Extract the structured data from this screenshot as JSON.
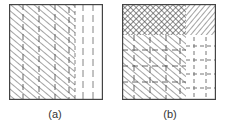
{
  "figure": {
    "panels": [
      {
        "id": "a",
        "label": "(a)",
        "regions": [
          {
            "name": "diagonal-hatch-with-dashed-verticals",
            "x_frac": [
              0,
              0.7
            ],
            "y_frac": [
              0,
              1
            ]
          },
          {
            "name": "dashed-vertical-lines",
            "x_frac": [
              0.7,
              1
            ],
            "y_frac": [
              0,
              1
            ]
          }
        ]
      },
      {
        "id": "b",
        "label": "(b)",
        "regions": [
          {
            "name": "cross-hatch",
            "x_frac": [
              0,
              0.68
            ],
            "y_frac": [
              0,
              0.33
            ]
          },
          {
            "name": "diagonal-hatch",
            "x_frac": [
              0.68,
              1
            ],
            "y_frac": [
              0,
              0.33
            ]
          },
          {
            "name": "diagonal-hatch-with-dashed-grid",
            "x_frac": [
              0,
              0.68
            ],
            "y_frac": [
              0.33,
              1
            ]
          },
          {
            "name": "dashed-crosses",
            "x_frac": [
              0.68,
              1
            ],
            "y_frac": [
              0.33,
              1
            ]
          }
        ]
      }
    ],
    "colors": {
      "line": "#555555",
      "border": "#444444",
      "background": "#ffffff"
    }
  }
}
